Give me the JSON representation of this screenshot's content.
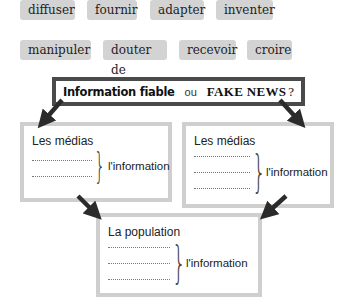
{
  "word_bank": {
    "row1": [
      "diffuser",
      "fournir",
      "adapter",
      "inventer"
    ],
    "row2": [
      "manipuler",
      "douter de",
      "recevoir",
      "croire"
    ]
  },
  "title": {
    "reliable": "Information fiable",
    "or": "ou",
    "fake": "FAKE NEWS",
    "question_mark": "?"
  },
  "boxes": {
    "left": {
      "label": "Les médias",
      "blank_lines": 2,
      "object": "l'information"
    },
    "right": {
      "label": "Les médias",
      "blank_lines": 3,
      "object": "l'information"
    },
    "bottom": {
      "label": "La population",
      "blank_lines": 3,
      "object": "l'information"
    }
  },
  "colors": {
    "chip_bg": "#d3d3d3",
    "title_border": "#4a4a4a",
    "box_border": "#cfcfcf",
    "arrow": "#2b2b2b"
  }
}
